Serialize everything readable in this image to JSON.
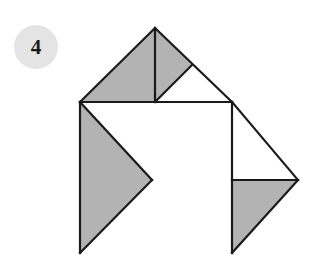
{
  "canvas": {
    "width": 319,
    "height": 264,
    "background": "#ffffff"
  },
  "badge": {
    "label": "4",
    "fill": "#e4e4e4",
    "text_color": "#1a1a1a",
    "cx": 36,
    "cy": 47,
    "r": 22
  },
  "figure": {
    "name": "tangram-arrangement",
    "stroke": "#1a1a1a",
    "stroke_width": 2.2,
    "fill_gray": "#b3b3b3",
    "fill_white": "#ffffff",
    "vertices": {
      "apex": [
        155,
        28
      ],
      "left": [
        80,
        102
      ],
      "mid_top": [
        155,
        102
      ],
      "notch": [
        192,
        65
      ],
      "right_top": [
        232,
        102
      ],
      "far_right": [
        298,
        180
      ],
      "mid_right": [
        152,
        180
      ],
      "right_mid": [
        232,
        180
      ],
      "bottom_left": [
        80,
        253
      ],
      "bottom_right": [
        232,
        253
      ]
    },
    "pieces": [
      {
        "name": "large-triangle-upper-left",
        "fill": "gray",
        "points": "80,102 155,28 155,102"
      },
      {
        "name": "small-triangle-apex-right",
        "fill": "gray",
        "points": "155,28 192,65 155,102"
      },
      {
        "name": "small-triangle-notch-white",
        "fill": "white",
        "points": "192,65 232,102 155,102"
      },
      {
        "name": "upper-right-white-wedge",
        "fill": "white",
        "points": "155,28 232,102 192,65"
      },
      {
        "name": "large-triangle-left",
        "fill": "gray",
        "points": "80,102 152,180 80,253"
      },
      {
        "name": "center-white-square",
        "fill": "white",
        "points": "80,102 232,102 232,253 80,253"
      },
      {
        "name": "medium-triangle-right-white",
        "fill": "white",
        "points": "232,102 298,180 232,180"
      },
      {
        "name": "medium-triangle-right-gray",
        "fill": "gray",
        "points": "232,180 298,180 232,253"
      }
    ],
    "edges": [
      {
        "name": "edge-apex-to-left",
        "d": "M155,28 L80,102"
      },
      {
        "name": "edge-apex-to-right-top",
        "d": "M155,28 L232,102"
      },
      {
        "name": "edge-apex-vertical",
        "d": "M155,28 L155,102"
      },
      {
        "name": "edge-notch-diagonal",
        "d": "M192,65 L155,102"
      },
      {
        "name": "edge-horizontal-top",
        "d": "M80,102 L232,102"
      },
      {
        "name": "edge-left-vertical",
        "d": "M80,102 L80,253"
      },
      {
        "name": "edge-left-diag-down",
        "d": "M80,102 L152,180"
      },
      {
        "name": "edge-left-diag-up",
        "d": "M152,180 L80,253"
      },
      {
        "name": "edge-right-vertical",
        "d": "M232,102 L232,253"
      },
      {
        "name": "edge-right-diag-down",
        "d": "M232,102 L298,180"
      },
      {
        "name": "edge-right-horizontal",
        "d": "M232,180 L298,180"
      },
      {
        "name": "edge-right-diag-up",
        "d": "M298,180 L232,253"
      }
    ]
  }
}
